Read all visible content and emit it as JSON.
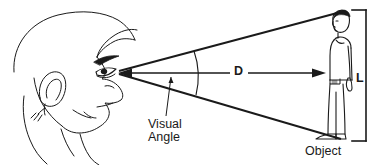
{
  "figure": {
    "type": "line-drawing-diagram",
    "background_color": "#ffffff",
    "stroke_color": "#1a1a1a",
    "text_color": "#1a1a1a",
    "width": 373,
    "height": 165
  },
  "labels": {
    "distance": "D",
    "size": "L",
    "visual_angle_line1": "Visual",
    "visual_angle_line2": "Angle",
    "object": "Object"
  },
  "elements": {
    "observer_head_name": "observer-head-profile",
    "object_person_name": "standing-person-object",
    "upper_ray_name": "upper-sight-ray",
    "lower_ray_name": "lower-sight-ray",
    "angle_arc_name": "visual-angle-arc",
    "distance_arrow_name": "distance-double-arrow",
    "size_bracket_name": "object-height-bracket",
    "leader_line_name": "visual-angle-leader-line"
  }
}
